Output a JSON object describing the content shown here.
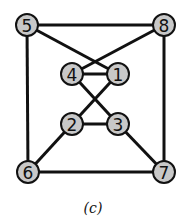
{
  "caption": "(c)",
  "nodes": [
    {
      "id": "5",
      "label": "5",
      "x": 27,
      "y": 25
    },
    {
      "id": "8",
      "label": "8",
      "x": 164,
      "y": 25
    },
    {
      "id": "4",
      "label": "4",
      "x": 72,
      "y": 74
    },
    {
      "id": "1",
      "label": "1",
      "x": 118,
      "y": 74
    },
    {
      "id": "2",
      "label": "2",
      "x": 72,
      "y": 124
    },
    {
      "id": "3",
      "label": "3",
      "x": 118,
      "y": 124
    },
    {
      "id": "6",
      "label": "6",
      "x": 28,
      "y": 172
    },
    {
      "id": "7",
      "label": "7",
      "x": 164,
      "y": 172
    }
  ],
  "edges": [
    [
      "5",
      "8"
    ],
    [
      "5",
      "6"
    ],
    [
      "8",
      "7"
    ],
    [
      "6",
      "7"
    ],
    [
      "5",
      "1"
    ],
    [
      "8",
      "4"
    ],
    [
      "4",
      "1"
    ],
    [
      "4",
      "3"
    ],
    [
      "1",
      "2"
    ],
    [
      "2",
      "3"
    ],
    [
      "2",
      "6"
    ],
    [
      "3",
      "7"
    ]
  ],
  "colors": {
    "node_fill": "#c8c8c8",
    "stroke": "#111111"
  }
}
